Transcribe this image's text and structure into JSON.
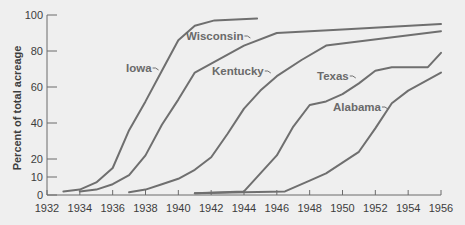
{
  "chart_data": {
    "type": "line",
    "title": "",
    "xlabel": "",
    "ylabel": "Percent of total acreage",
    "xlim": [
      1932,
      1956
    ],
    "ylim": [
      0,
      100
    ],
    "x_ticks": [
      1932,
      1934,
      1936,
      1938,
      1940,
      1942,
      1944,
      1946,
      1948,
      1950,
      1952,
      1954,
      1956
    ],
    "y_ticks": [
      0,
      10,
      20,
      40,
      60,
      80,
      100
    ],
    "grid": false,
    "legend": "inline labels",
    "series": [
      {
        "name": "Iowa",
        "x": [
          1933,
          1934,
          1935,
          1936,
          1937,
          1938,
          1939,
          1940,
          1941,
          1942.2,
          1944.8
        ],
        "values": [
          2,
          3,
          7,
          15,
          36,
          52,
          69,
          86,
          94,
          97,
          98
        ],
        "label_pos": [
          126,
          72
        ]
      },
      {
        "name": "Wisconsin",
        "x": [
          1934,
          1935,
          1936,
          1937,
          1938,
          1939,
          1940,
          1941,
          1942,
          1944,
          1946,
          1950,
          1956
        ],
        "values": [
          2,
          3,
          6,
          11,
          22,
          39,
          53,
          68,
          73,
          83,
          90,
          92,
          95
        ],
        "label_pos": [
          186,
          40
        ]
      },
      {
        "name": "Kentucky",
        "x": [
          1937,
          1938,
          1939,
          1940,
          1941,
          1942,
          1943,
          1944,
          1945,
          1946,
          1947.5,
          1949,
          1956
        ],
        "values": [
          1.5,
          3,
          6,
          9,
          14,
          21,
          34,
          48,
          58,
          66,
          75,
          83,
          91
        ],
        "label_pos": [
          212,
          75
        ]
      },
      {
        "name": "Texas",
        "x": [
          1941,
          1944,
          1945,
          1946,
          1947,
          1948,
          1949,
          1950,
          1951,
          1952,
          1953,
          1955.2,
          1956
        ],
        "values": [
          1,
          2,
          12,
          22,
          38,
          50,
          52,
          56,
          62,
          69,
          71,
          71,
          79
        ],
        "label_pos": [
          317,
          80
        ]
      },
      {
        "name": "Alabama",
        "x": [
          1941,
          1944,
          1946.5,
          1948,
          1949,
          1950,
          1951,
          1952,
          1953,
          1954,
          1956
        ],
        "values": [
          1,
          1.5,
          2,
          8,
          12,
          18,
          24,
          37,
          51,
          58,
          68
        ],
        "label_pos": [
          333,
          111
        ]
      }
    ]
  }
}
